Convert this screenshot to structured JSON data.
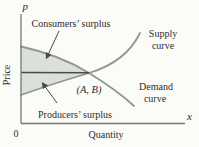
{
  "figure": {
    "background": "#fbfbf7",
    "colors": {
      "curve": "#8f9794",
      "region_fill": "#dbe0d9",
      "equilibrium_line": "#4a4a4a",
      "axis": "#767676",
      "arrow": "#4a4a4a",
      "text": "#2e2e2e"
    },
    "axes": {
      "y_symbol": "p",
      "y_title": "Price",
      "x_symbol": "x",
      "x_title": "Quantity",
      "origin": "0"
    },
    "labels": {
      "consumers_surplus": "Consumers’ surplus",
      "producers_surplus": "Producers’ surplus",
      "supply_line1": "Supply",
      "supply_line2": "curve",
      "demand_line1": "Demand",
      "demand_line2": "curve",
      "equilibrium_point": "(A, B)"
    }
  }
}
